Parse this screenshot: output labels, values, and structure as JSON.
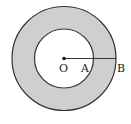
{
  "diagram": {
    "type": "annulus",
    "center": {
      "label": "O",
      "x": 64,
      "y": 58.5
    },
    "outer_circle": {
      "radius": 52
    },
    "inner_circle": {
      "radius": 29.5
    },
    "points": [
      {
        "label": "O"
      },
      {
        "label": "A"
      },
      {
        "label": "B"
      }
    ],
    "colors": {
      "ring_fill": "#cfcfcf",
      "stroke": "#333333",
      "background": "#ffffff"
    }
  }
}
